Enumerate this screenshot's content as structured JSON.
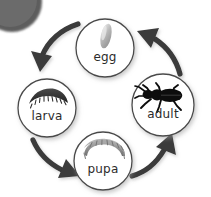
{
  "diagram": {
    "type": "cycle-diagram",
    "background_color": "#ffffff",
    "stroke_color": "#3a3a3a",
    "circle_fill": "#ffffff",
    "corner_blob_color": "#5a5a5a",
    "stages": [
      {
        "id": "egg",
        "label": "egg",
        "position": "top",
        "cx": 105,
        "cy": 48,
        "r": 29,
        "label_x": 105,
        "label_y": 57,
        "font_size": 12,
        "art": "egg-capsule-icon",
        "art_color": "#9b9b9b"
      },
      {
        "id": "larva",
        "label": "larva",
        "position": "left",
        "cx": 47,
        "cy": 108,
        "r": 29,
        "label_x": 47,
        "label_y": 116,
        "font_size": 12,
        "art": "larva-grub-icon",
        "art_color": "#3c3c3c"
      },
      {
        "id": "pupa",
        "label": "pupa",
        "position": "bottom",
        "cx": 103,
        "cy": 161,
        "r": 29,
        "label_x": 103,
        "label_y": 169,
        "font_size": 12,
        "art": "pupa-icon",
        "art_color": "#8f8f8f"
      },
      {
        "id": "adult",
        "label": "adult",
        "position": "right",
        "cx": 163,
        "cy": 105,
        "r": 31,
        "label_x": 163,
        "label_y": 114,
        "font_size": 12,
        "art": "beetle-silhouette-icon",
        "art_color": "#111111"
      }
    ],
    "arrows": [
      {
        "id": "egg-to-larva",
        "from": "egg",
        "to": "larva",
        "direction": "down-left"
      },
      {
        "id": "larva-to-pupa",
        "from": "larva",
        "to": "pupa",
        "direction": "down-right"
      },
      {
        "id": "pupa-to-adult",
        "from": "pupa",
        "to": "adult",
        "direction": "up-right"
      },
      {
        "id": "adult-to-egg",
        "from": "adult",
        "to": "egg",
        "direction": "up-left"
      }
    ]
  }
}
